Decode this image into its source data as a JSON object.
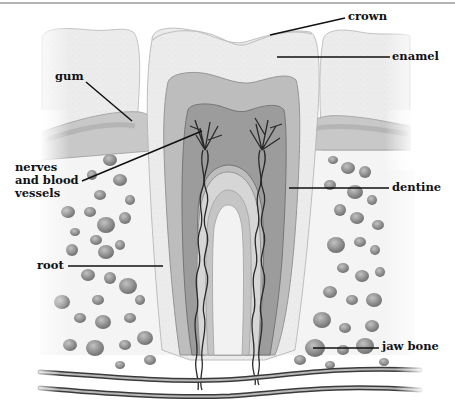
{
  "diagram": {
    "colors": {
      "background": "#ffffff",
      "frame_line": "#9a9a9a",
      "enamel": "#ececec",
      "enamel_speckle": "#dcdcdc",
      "dentine": "#bdbdbd",
      "pulp": "#9c9c9c",
      "gum": "#c8c8c8",
      "gum_dark": "#a8a8a8",
      "bone": "#f4f4f4",
      "bone_holes": "#8a8a8a",
      "nerve": "#2a2a2a",
      "leader": "#111111",
      "label_text": "#111111"
    },
    "labels": [
      {
        "id": "crown",
        "text": "crown",
        "x": 348,
        "y": 10,
        "leader": [
          [
            270,
            35
          ],
          [
            345,
            18
          ]
        ]
      },
      {
        "id": "enamel",
        "text": "enamel",
        "x": 392,
        "y": 50,
        "leader": [
          [
            277,
            57
          ],
          [
            390,
            57
          ]
        ]
      },
      {
        "id": "gum",
        "text": "gum",
        "x": 55,
        "y": 70,
        "leader": [
          [
            86,
            82
          ],
          [
            132,
            121
          ]
        ]
      },
      {
        "id": "nerves",
        "lines": [
          "nerves",
          "and blood",
          "vessels"
        ],
        "x": 15,
        "y": 161,
        "leader": [
          [
            82,
            181
          ],
          [
            202,
            131
          ]
        ]
      },
      {
        "id": "dentine",
        "text": "dentine",
        "x": 392,
        "y": 181,
        "leader": [
          [
            289,
            188
          ],
          [
            389,
            188
          ]
        ]
      },
      {
        "id": "root",
        "text": "root",
        "x": 37,
        "y": 259,
        "leader": [
          [
            68,
            266
          ],
          [
            163,
            266
          ]
        ]
      },
      {
        "id": "jaw-bone",
        "text": "jaw bone",
        "x": 382,
        "y": 340,
        "leader": [
          [
            313,
            348
          ],
          [
            379,
            348
          ]
        ]
      }
    ]
  }
}
